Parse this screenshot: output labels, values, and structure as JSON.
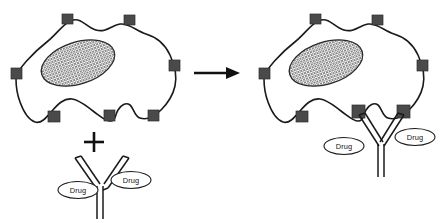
{
  "figure": {
    "panels": [
      {
        "id": "before",
        "name": "unbound-state",
        "label": ""
      },
      {
        "id": "after",
        "name": "bound-state",
        "label": ""
      }
    ],
    "operator_plus": "+",
    "arrow": "arrow-right-icon"
  },
  "labels": {
    "drug": "Drug"
  },
  "colors": {
    "receptor_fill": "#4a4a4a",
    "outline": "#1a1a1a",
    "nucleus_hatch": "#6e6e6e",
    "background": "#ffffff"
  },
  "left_panel": {
    "cell": {
      "name": "cell-body-left",
      "receptor_count": 7
    },
    "nucleus": {
      "name": "nucleus-left",
      "pattern": "cross-hatch"
    },
    "antibody": {
      "name": "antibody-free",
      "arms": 2,
      "drug_labels": [
        "Drug",
        "Drug"
      ]
    }
  },
  "right_panel": {
    "cell": {
      "name": "cell-body-right",
      "receptor_count": 7
    },
    "nucleus": {
      "name": "nucleus-right",
      "pattern": "cross-hatch"
    },
    "antibody": {
      "name": "antibody-bound",
      "arms": 2,
      "drug_labels": [
        "Drug",
        "Drug"
      ],
      "bound_receptors": 2
    }
  }
}
